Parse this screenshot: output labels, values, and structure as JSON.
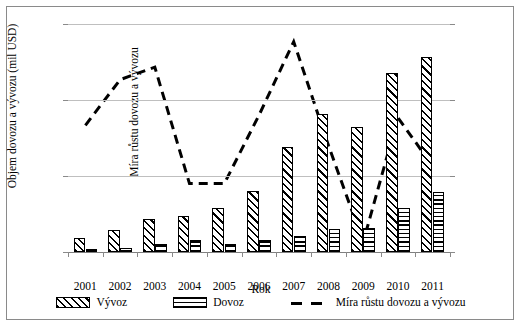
{
  "chart_data": {
    "type": "bar",
    "title": "",
    "xlabel": "Rok",
    "ylabel": "Objem dovozu a vývozu (mil USD)",
    "ylabel_secondary": "Míra růstu dovozu a vývozu",
    "categories": [
      "2001",
      "2002",
      "2003",
      "2004",
      "2005",
      "2006",
      "2007",
      "2008",
      "2009",
      "2010",
      "2011"
    ],
    "ylim": [
      0,
      9000
    ],
    "yticks": [
      "0",
      "3000",
      "6000",
      "9000"
    ],
    "ylim_secondary": [
      -10,
      80
    ],
    "yticks_secondary": [
      "-10%",
      "0%",
      "10%",
      "20%",
      "30%",
      "40%",
      "50%",
      "60%",
      "70%",
      "80%"
    ],
    "grid": true,
    "legend_position": "bottom",
    "series": [
      {
        "name": "Vývoz",
        "type": "bar",
        "axis": "left",
        "values": [
          570,
          880,
          1310,
          1420,
          1720,
          2400,
          4150,
          5450,
          4950,
          7050,
          7700
        ]
      },
      {
        "name": "Dovoz",
        "type": "bar",
        "axis": "left",
        "values": [
          105,
          175,
          330,
          460,
          330,
          480,
          620,
          900,
          930,
          1750,
          2350
        ]
      },
      {
        "name": "Míra růstu dovozu a vývozu",
        "type": "line",
        "axis": "right",
        "style": "dashed",
        "values": [
          40,
          58,
          63,
          17,
          17,
          44,
          73,
          32,
          -6,
          43,
          24
        ]
      }
    ]
  },
  "legend": {
    "items": [
      {
        "label": "Vývoz",
        "marker": "diagonal-hatch-swatch"
      },
      {
        "label": "Dovoz",
        "marker": "horizontal-hatch-swatch"
      },
      {
        "label": "Míra růstu dovozu a vývozu",
        "marker": "dashed-line-swatch"
      }
    ]
  }
}
